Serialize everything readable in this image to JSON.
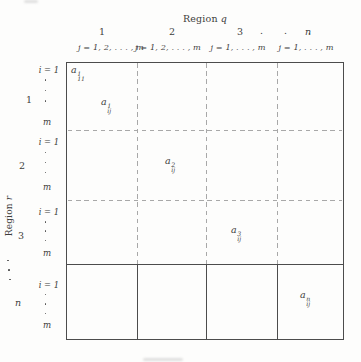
{
  "figure": {
    "top_axis": {
      "title_prefix": "Region",
      "title_var": "q",
      "column_numbers": [
        "1",
        "2",
        "3",
        "n"
      ],
      "column_ellipsis": ". . .",
      "column_ranges": [
        "j = 1, 2, . . . , m",
        "j = 1, 2, . . . , m",
        "j = 1, . . . , m",
        "j = 1, . . . , m"
      ]
    },
    "left_axis": {
      "title_prefix": "Region",
      "title_var": "r",
      "row_numbers": [
        "1",
        "2",
        "3",
        "n"
      ],
      "row_i_labels": [
        "i = 1",
        "i = 1",
        "i = 1",
        "i = 1"
      ],
      "row_m_labels": [
        "m",
        "m",
        "m",
        "m"
      ]
    },
    "cells": [
      {
        "base": "a",
        "sup": "1",
        "sub": "11"
      },
      {
        "base": "a",
        "sup": "1",
        "sub": "ij"
      },
      {
        "base": "a",
        "sup": "2",
        "sub": "ij"
      },
      {
        "base": "a",
        "sup": "3",
        "sub": "ij"
      },
      {
        "base": "a",
        "sup": "n",
        "sub": "ij"
      }
    ]
  },
  "colors": {
    "solid_line": "#4c4c4c",
    "dashed_line": "#a8a8a8",
    "text": "#3d3d3d",
    "background": "#fdfdfc"
  }
}
